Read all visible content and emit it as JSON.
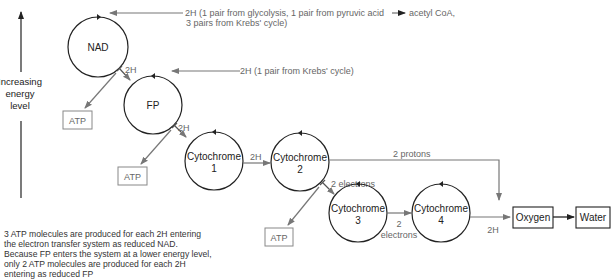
{
  "axis": {
    "label_lines": [
      "Increasing",
      "energy",
      "level"
    ]
  },
  "inputs": {
    "nad_source_lines": [
      "2H (1 pair from glycolysis, 1 pair from pyruvic acid",
      "3 pairs from Krebs' cycle)"
    ],
    "nad_source_suffix": "acetyl CoA,",
    "fp_source": "2H (1 pair from Krebs' cycle)"
  },
  "nodes": {
    "nad": "NAD",
    "fp": "FP",
    "cyt1": [
      "Cytochrome",
      "1"
    ],
    "cyt2": [
      "Cytochrome",
      "2"
    ],
    "cyt3": [
      "Cytochrome",
      "3"
    ],
    "cyt4": [
      "Cytochrome",
      "4"
    ],
    "oxygen": "Oxygen",
    "water": "Water"
  },
  "atp_boxes": [
    "ATP",
    "ATP",
    "ATP"
  ],
  "edge_labels": {
    "nad_fp": "2H",
    "fp_cyt1": "2H",
    "cyt1_cyt2": "2H",
    "cyt2_cyt3": "2 electrons",
    "cyt3_cyt4": [
      "2",
      "electrons"
    ],
    "cyt4_oxygen": "2H",
    "cyt2_oxygen": "2 protons"
  },
  "note_lines": [
    "3 ATP molecules are produced for each 2H entering",
    "the electron transfer system as reduced NAD.",
    "Because FP enters the system at a lower energy level,",
    "only 2 ATP molecules are produced for each 2H",
    "entering as reduced FP"
  ],
  "colors": {
    "line_dark": "#222222",
    "line_gray": "#777777",
    "text_gray": "#666666"
  }
}
